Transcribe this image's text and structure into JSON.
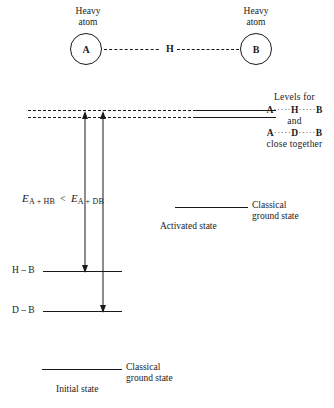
{
  "figure": {
    "background_color": "#ffffff",
    "line_color": "#1a1a1a"
  },
  "molecule": {
    "left_atom": {
      "symbol": "A",
      "caption": "Heavy\natom"
    },
    "bridging_atom": {
      "symbol": "H"
    },
    "right_atom": {
      "symbol": "B",
      "caption": "Heavy\natom"
    }
  },
  "levels_note": {
    "line1": "Levels for",
    "line2_left": "A",
    "line2_mid": "H",
    "line2_right": "B",
    "line3": "and",
    "line4_left": "A",
    "line4_mid": "D",
    "line4_right": "B",
    "line5": "close together",
    "dots": "·····"
  },
  "equation": {
    "left_E": "E",
    "left_sub": "A + HB",
    "operator": "<",
    "right_E": "E",
    "right_sub": "A + DB"
  },
  "states": {
    "activated": {
      "label": "Activated state",
      "classical_line1": "Classical",
      "classical_line2": "ground state"
    },
    "initial": {
      "label": "Initial state",
      "classical_line1": "Classical",
      "classical_line2": "ground state"
    }
  },
  "vibrational_levels": [
    {
      "name": "hb-level",
      "label": "H – B"
    },
    {
      "name": "db-level",
      "label": "D – B"
    }
  ]
}
